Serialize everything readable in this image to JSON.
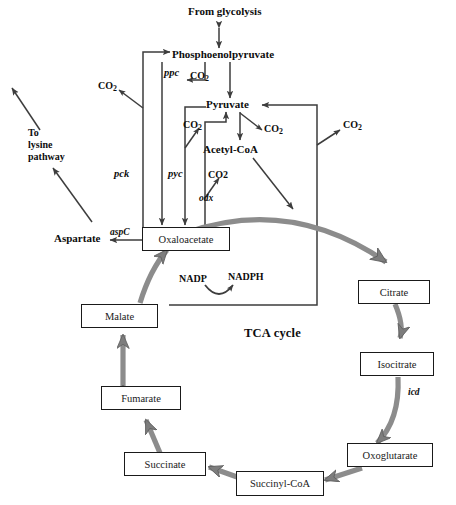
{
  "diagram": {
    "title": "TCA cycle",
    "type": "metabolic-pathway",
    "colors": {
      "thin_arrow": "#3d3d3d",
      "thick_arrow": "#8c8c8c",
      "box_border": "#1a1a1a",
      "text": "#111111",
      "background": "#ffffff"
    }
  },
  "nodes": {
    "from_glycolysis": "From glycolysis",
    "pep": "Phosphoenolpyruvate",
    "pyruvate": "Pyruvate",
    "acetyl_coa": "Acetyl-CoA",
    "aspartate": "Aspartate",
    "to_lysine": "To\nlysine\npathway",
    "to_lysine_l1": "To",
    "to_lysine_l2": "lysine",
    "to_lysine_l3": "pathway",
    "co2_a": "CO",
    "co2_a_sub": "2",
    "co2_b": "CO",
    "co2_b_sub": "2",
    "co2_c": "CO",
    "co2_c_sub": "2",
    "co2_d": "CO",
    "co2_d_sub": "2",
    "co2_e": "CO",
    "co2_e_sub": "2",
    "co2_plain": "CO2",
    "nadp": "NADP",
    "nadph": "NADPH",
    "tca_label": "TCA cycle"
  },
  "boxed_nodes": [
    {
      "id": "oxaloacetate",
      "label": "Oxaloacetate"
    },
    {
      "id": "citrate",
      "label": "Citrate"
    },
    {
      "id": "isocitrate",
      "label": "Isocitrate"
    },
    {
      "id": "oxoglutarate",
      "label": "Oxoglutarate"
    },
    {
      "id": "succinyl-coa",
      "label": "Succinyl-CoA"
    },
    {
      "id": "succinate",
      "label": "Succinate"
    },
    {
      "id": "fumarate",
      "label": "Fumarate"
    },
    {
      "id": "malate",
      "label": "Malate"
    }
  ],
  "genes": [
    {
      "id": "ppc",
      "label": "ppc"
    },
    {
      "id": "pck",
      "label": "pck"
    },
    {
      "id": "pyc",
      "label": "pyc"
    },
    {
      "id": "odx",
      "label": "odx"
    },
    {
      "id": "aspC",
      "label": "aspC"
    },
    {
      "id": "icd",
      "label": "icd"
    }
  ],
  "reactions": [
    {
      "from": "From glycolysis",
      "to": "Phosphoenolpyruvate",
      "reversible": true,
      "enzyme": ""
    },
    {
      "from": "Phosphoenolpyruvate",
      "to": "Oxaloacetate",
      "reversible": false,
      "enzyme": "ppc",
      "byproduct": "CO2"
    },
    {
      "from": "Oxaloacetate",
      "to": "Phosphoenolpyruvate",
      "reversible": false,
      "enzyme": "pck",
      "byproduct": "CO2"
    },
    {
      "from": "Pyruvate",
      "to": "Oxaloacetate",
      "reversible": false,
      "enzyme": "pyc",
      "byproduct": "CO2"
    },
    {
      "from": "Oxaloacetate",
      "to": "Pyruvate",
      "reversible": false,
      "enzyme": "odx",
      "byproduct": "CO2"
    },
    {
      "from": "Phosphoenolpyruvate",
      "to": "Pyruvate",
      "reversible": false,
      "enzyme": "",
      "byproduct": "CO2"
    },
    {
      "from": "Pyruvate",
      "to": "Acetyl-CoA",
      "reversible": false,
      "enzyme": "",
      "byproduct": "CO2"
    },
    {
      "from": "Oxaloacetate",
      "to": "Aspartate",
      "reversible": false,
      "enzyme": "aspC"
    },
    {
      "from": "Aspartate",
      "to": "To lysine pathway",
      "reversible": false,
      "enzyme": ""
    },
    {
      "from": "Oxaloacetate",
      "to": "Citrate",
      "reversible": false,
      "enzyme": ""
    },
    {
      "from": "Citrate",
      "to": "Isocitrate",
      "reversible": false,
      "enzyme": ""
    },
    {
      "from": "Isocitrate",
      "to": "Oxoglutarate",
      "reversible": false,
      "enzyme": "icd"
    },
    {
      "from": "Oxoglutarate",
      "to": "Succinyl-CoA",
      "reversible": false,
      "enzyme": ""
    },
    {
      "from": "Succinyl-CoA",
      "to": "Succinate",
      "reversible": false,
      "enzyme": ""
    },
    {
      "from": "Succinate",
      "to": "Fumarate",
      "reversible": true,
      "enzyme": ""
    },
    {
      "from": "Fumarate",
      "to": "Malate",
      "reversible": true,
      "enzyme": ""
    },
    {
      "from": "Malate",
      "to": "Oxaloacetate",
      "reversible": false,
      "enzyme": "",
      "cofactor_in": "NADP",
      "cofactor_out": "NADPH"
    }
  ]
}
